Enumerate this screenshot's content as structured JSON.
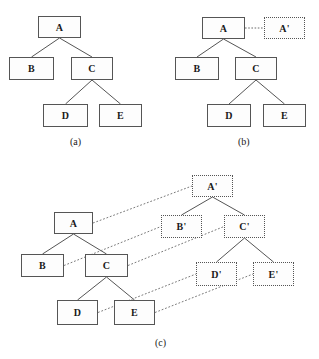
{
  "figure": {
    "caption_style": "(x)",
    "panels": [
      {
        "id": "a",
        "label": "(a)",
        "description": "Original tree",
        "nodes": [
          {
            "id": "A",
            "label": "A",
            "style": "solid",
            "x": 38,
            "y": 16,
            "w": 43,
            "h": 22
          },
          {
            "id": "B",
            "label": "B",
            "style": "solid",
            "x": 9,
            "y": 57,
            "w": 45,
            "h": 23
          },
          {
            "id": "C",
            "label": "C",
            "style": "solid",
            "x": 71,
            "y": 57,
            "w": 42,
            "h": 23
          },
          {
            "id": "D",
            "label": "D",
            "style": "solid",
            "x": 43,
            "y": 104,
            "w": 45,
            "h": 23
          },
          {
            "id": "E",
            "label": "E",
            "style": "solid",
            "x": 99,
            "y": 104,
            "w": 43,
            "h": 23
          }
        ],
        "edges": [
          {
            "from": "A",
            "to": "B",
            "style": "solid"
          },
          {
            "from": "A",
            "to": "C",
            "style": "solid"
          },
          {
            "from": "C",
            "to": "D",
            "style": "solid"
          },
          {
            "from": "C",
            "to": "E",
            "style": "solid"
          }
        ],
        "label_x": 70,
        "label_y": 136
      },
      {
        "id": "b",
        "label": "(b)",
        "description": "Tree with new copied root A-prime attached by dotted link",
        "nodes": [
          {
            "id": "A",
            "label": "A",
            "style": "solid",
            "x": 202,
            "y": 17,
            "w": 43,
            "h": 22
          },
          {
            "id": "Ap",
            "label": "A'",
            "style": "dotted",
            "x": 264,
            "y": 17,
            "w": 41,
            "h": 22
          },
          {
            "id": "B",
            "label": "B",
            "style": "solid",
            "x": 175,
            "y": 57,
            "w": 44,
            "h": 23
          },
          {
            "id": "C",
            "label": "C",
            "style": "solid",
            "x": 235,
            "y": 57,
            "w": 42,
            "h": 23
          },
          {
            "id": "D",
            "label": "D",
            "style": "solid",
            "x": 207,
            "y": 104,
            "w": 44,
            "h": 23
          },
          {
            "id": "E",
            "label": "E",
            "style": "solid",
            "x": 263,
            "y": 104,
            "w": 43,
            "h": 23
          }
        ],
        "edges": [
          {
            "from": "A",
            "to": "Ap",
            "style": "dotted"
          },
          {
            "from": "A",
            "to": "B",
            "style": "solid"
          },
          {
            "from": "A",
            "to": "C",
            "style": "solid"
          },
          {
            "from": "C",
            "to": "D",
            "style": "solid"
          },
          {
            "from": "C",
            "to": "E",
            "style": "solid"
          }
        ],
        "label_x": 238,
        "label_y": 136
      },
      {
        "id": "c",
        "label": "(c)",
        "description": "Original tree and full copied tree with dotted correspondence mapping",
        "nodes": [
          {
            "id": "A",
            "label": "A",
            "style": "solid",
            "x": 54,
            "y": 212,
            "w": 39,
            "h": 22
          },
          {
            "id": "B",
            "label": "B",
            "style": "solid",
            "x": 21,
            "y": 254,
            "w": 43,
            "h": 23
          },
          {
            "id": "C",
            "label": "C",
            "style": "solid",
            "x": 85,
            "y": 254,
            "w": 43,
            "h": 23
          },
          {
            "id": "D",
            "label": "D",
            "style": "solid",
            "x": 57,
            "y": 300,
            "w": 41,
            "h": 25
          },
          {
            "id": "E",
            "label": "E",
            "style": "solid",
            "x": 114,
            "y": 300,
            "w": 41,
            "h": 25
          },
          {
            "id": "Ap",
            "label": "A'",
            "style": "dotted",
            "x": 192,
            "y": 175,
            "w": 41,
            "h": 22
          },
          {
            "id": "Bp",
            "label": "B'",
            "style": "dotted",
            "x": 161,
            "y": 215,
            "w": 41,
            "h": 23
          },
          {
            "id": "Cp",
            "label": "C'",
            "style": "dotted",
            "x": 224,
            "y": 215,
            "w": 41,
            "h": 23
          },
          {
            "id": "Dp",
            "label": "D'",
            "style": "dotted",
            "x": 196,
            "y": 262,
            "w": 41,
            "h": 24
          },
          {
            "id": "Ep",
            "label": "E'",
            "style": "dotted",
            "x": 253,
            "y": 262,
            "w": 41,
            "h": 24
          }
        ],
        "edges": [
          {
            "from": "A",
            "to": "B",
            "style": "solid"
          },
          {
            "from": "A",
            "to": "C",
            "style": "solid"
          },
          {
            "from": "C",
            "to": "D",
            "style": "solid"
          },
          {
            "from": "C",
            "to": "E",
            "style": "solid"
          },
          {
            "from": "Ap",
            "to": "Bp",
            "style": "solid"
          },
          {
            "from": "Ap",
            "to": "Cp",
            "style": "solid"
          },
          {
            "from": "Cp",
            "to": "Dp",
            "style": "solid"
          },
          {
            "from": "Cp",
            "to": "Ep",
            "style": "solid"
          },
          {
            "from": "A",
            "to": "Ap",
            "style": "map"
          },
          {
            "from": "B",
            "to": "Bp",
            "style": "map"
          },
          {
            "from": "C",
            "to": "Cp",
            "style": "map"
          },
          {
            "from": "D",
            "to": "Dp",
            "style": "map"
          },
          {
            "from": "E",
            "to": "Ep",
            "style": "map"
          }
        ],
        "label_x": 155,
        "label_y": 337
      }
    ]
  },
  "colors": {
    "node_border": "#555555",
    "node_fill": "#fdfdfd",
    "edge_solid": "#555555",
    "edge_dotted": "#7a7a7a",
    "text": "#1a1a1a",
    "background": "#ffffff"
  }
}
